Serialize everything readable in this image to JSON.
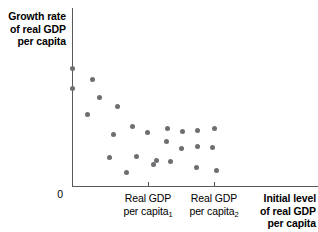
{
  "figure": {
    "y_axis_title": "Growth rate\nof real GDP\nper capita",
    "y_axis_title_lines": [
      "Growth rate",
      "of real GDP",
      "per capita"
    ],
    "x_axis_title_lines": [
      "Initial level",
      "of real GDP",
      "per capita"
    ],
    "origin_label": "0",
    "tick_labels": [
      {
        "line1": "Real GDP",
        "line2": "per capita",
        "subscript": "1"
      },
      {
        "line1": "Real GDP",
        "line2": "per capita",
        "subscript": "2"
      }
    ],
    "colors": {
      "axis": "#58595b",
      "point": "#6d6e71",
      "text": "#000000",
      "background": "#ffffff"
    }
  },
  "chart_data": {
    "type": "scatter",
    "title": "",
    "xlabel": "Initial level of real GDP per capita",
    "ylabel": "Growth rate of real GDP per capita",
    "grid": false,
    "legend": null,
    "axis_origin_label": "0",
    "xticks": [
      {
        "px": 148,
        "label": "Real GDP per capita₁"
      },
      {
        "px": 214,
        "label": "Real GDP per capita₂"
      }
    ],
    "annotation": "Negative relationship between initial real GDP per capita and subsequent growth rate (convergence).",
    "points_px": [
      [
        72,
        68
      ],
      [
        92,
        79
      ],
      [
        72,
        88
      ],
      [
        99,
        97
      ],
      [
        117,
        106
      ],
      [
        87,
        114
      ],
      [
        113,
        134
      ],
      [
        132,
        126
      ],
      [
        147,
        132
      ],
      [
        109,
        157
      ],
      [
        136,
        156
      ],
      [
        153,
        164
      ],
      [
        167,
        128
      ],
      [
        182,
        131
      ],
      [
        197,
        130
      ],
      [
        214,
        128
      ],
      [
        166,
        141
      ],
      [
        181,
        148
      ],
      [
        197,
        146
      ],
      [
        212,
        147
      ],
      [
        156,
        160
      ],
      [
        170,
        161
      ],
      [
        196,
        167
      ],
      [
        216,
        170
      ],
      [
        126,
        172
      ]
    ]
  }
}
